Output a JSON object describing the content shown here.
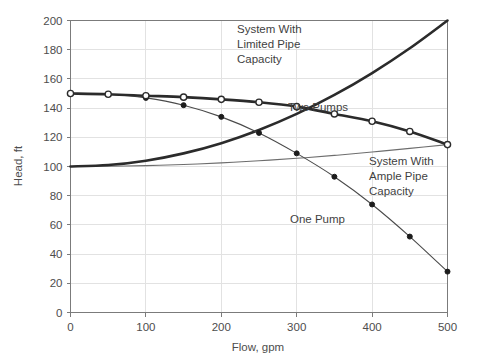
{
  "chart_data": {
    "type": "line",
    "title": "",
    "xlabel": "Flow, gpm",
    "ylabel": "Head, ft",
    "xlim": [
      0,
      500
    ],
    "ylim": [
      0,
      200
    ],
    "xticks": [
      0,
      100,
      200,
      300,
      400,
      500
    ],
    "yticks": [
      0,
      20,
      40,
      60,
      80,
      100,
      120,
      140,
      160,
      180,
      200
    ],
    "grid": true,
    "legend_position": "inline-annotations",
    "series": [
      {
        "name": "Two Pumps",
        "marker": "open-circle",
        "x": [
          0,
          50,
          100,
          150,
          200,
          250,
          300,
          350,
          400,
          450,
          500
        ],
        "y": [
          150,
          149.5,
          148.5,
          147.5,
          146,
          144,
          141,
          136,
          131,
          124,
          115
        ]
      },
      {
        "name": "One Pump",
        "marker": "filled-circle",
        "x": [
          0,
          50,
          100,
          150,
          200,
          250,
          300,
          350,
          400,
          450,
          500
        ],
        "y": [
          150,
          149.5,
          147,
          142,
          134,
          123,
          109,
          93,
          74,
          52,
          28
        ]
      },
      {
        "name": "System With Limited Pipe Capacity",
        "marker": "none",
        "x": [
          0,
          50,
          100,
          150,
          200,
          250,
          300,
          350,
          400,
          450,
          500
        ],
        "y": [
          100,
          101,
          104,
          109,
          116,
          125,
          136,
          149,
          164,
          181,
          200
        ]
      },
      {
        "name": "System With Ample Pipe Capacity",
        "marker": "none",
        "x": [
          0,
          50,
          100,
          150,
          200,
          250,
          300,
          350,
          400,
          450,
          500
        ],
        "y": [
          100,
          100.2,
          100.6,
          101.4,
          102.5,
          103.9,
          105.6,
          107.6,
          109.9,
          112.4,
          115
        ]
      }
    ],
    "annotations": [
      {
        "id": "ann-system-limited",
        "lines": [
          "System With",
          "Limited Pipe",
          "Capacity"
        ]
      },
      {
        "id": "ann-two-pumps",
        "lines": [
          "Two Pumps"
        ]
      },
      {
        "id": "ann-system-ample",
        "lines": [
          "System With",
          "Ample Pipe",
          "Capacity"
        ]
      },
      {
        "id": "ann-one-pump",
        "lines": [
          "One Pump"
        ]
      }
    ],
    "colors": {
      "pump_curve": "#2b2b2b",
      "single_pump": "#4a4a4a",
      "system_limited": "#2b2b2b",
      "system_ample": "#6d6d6d",
      "grid": "#e2e2e2",
      "frame": "#7b7b7b",
      "text": "#4d4d4d",
      "background": "#ffffff"
    }
  },
  "axes": {
    "x_tick_labels": [
      "0",
      "100",
      "200",
      "300",
      "400",
      "500"
    ],
    "y_tick_labels": [
      "0",
      "20",
      "40",
      "60",
      "80",
      "100",
      "120",
      "140",
      "160",
      "180",
      "200"
    ],
    "x_title": "Flow, gpm",
    "y_title": "Head, ft"
  },
  "labels": {
    "system_limited_l1": "System With",
    "system_limited_l2": "Limited Pipe",
    "system_limited_l3": "Capacity",
    "two_pumps": "Two Pumps",
    "system_ample_l1": "System With",
    "system_ample_l2": "Ample Pipe",
    "system_ample_l3": "Capacity",
    "one_pump": "One Pump"
  }
}
